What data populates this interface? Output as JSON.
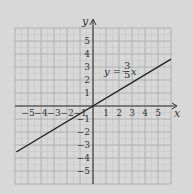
{
  "chart_data": {
    "type": "line",
    "title": "",
    "xlabel": "x",
    "ylabel": "y",
    "xlim": [
      -6,
      6
    ],
    "ylim": [
      -6,
      6
    ],
    "grid": true,
    "x_ticks": [
      "-5",
      "-4",
      "-3",
      "-2",
      "-1",
      "1",
      "2",
      "3",
      "4",
      "5"
    ],
    "y_ticks": [
      "5",
      "4",
      "3",
      "2",
      "1",
      "-1",
      "-2",
      "-3",
      "-4",
      "-5"
    ],
    "series": [
      {
        "name": "y = 3/5 x",
        "equation": "y = (3/5)x",
        "slope": 0.6,
        "intercept": 0,
        "x": [
          -5.9,
          6.0
        ],
        "y": [
          -3.54,
          3.6
        ]
      }
    ],
    "annotations": [
      {
        "text": "y = 3/5 x",
        "x": 3,
        "y": 2.9
      }
    ]
  },
  "labels": {
    "x_axis": "x",
    "y_axis": "y",
    "eq_lhs": "y =",
    "eq_num": "3",
    "eq_den": "5",
    "eq_var": "x"
  },
  "colors": {
    "background": "#d8d8d8",
    "grid_major": "#a8a8a8",
    "grid_minor": "#c4c4c4",
    "axis": "#333333",
    "line": "#222222"
  }
}
